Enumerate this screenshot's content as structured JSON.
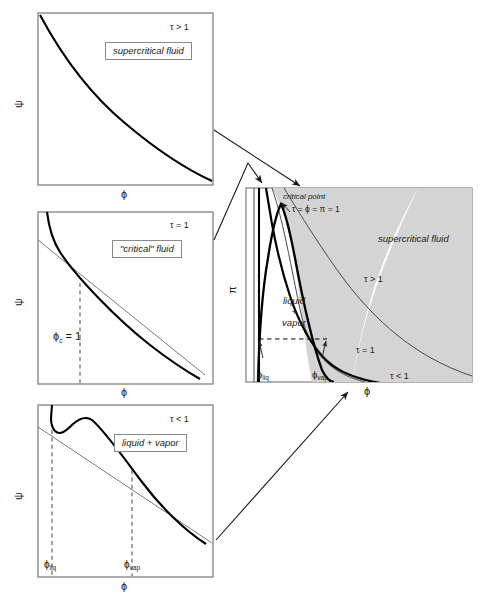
{
  "figure": {
    "type": "diagram",
    "colors": {
      "curve": "#000000",
      "tangent": "#5a5a5a",
      "frame": "#8a8a8a",
      "supercritical_shading": "#d4d4d4",
      "dashed": "#555555",
      "arrow": "#1a1a1a",
      "text": "#1a1a1a"
    }
  },
  "panels": {
    "top_left": {
      "name": "supercritical-panel",
      "tau_label": "τ > 1",
      "box_label": "supercritical fluid",
      "y_axis": "ψ",
      "x_axis": "ϕ"
    },
    "middle_left": {
      "name": "critical-panel",
      "tau_label": "τ = 1",
      "box_label": "\"critical\" fluid",
      "y_axis": "ψ",
      "x_axis": "ϕ",
      "phi_c_label": "ϕ",
      "phi_c_sub": "c",
      "phi_c_value": "= 1"
    },
    "bottom_left": {
      "name": "liquid-vapor-panel",
      "tau_label": "τ < 1",
      "box_label": "liquid + vapor",
      "y_axis": "ψ",
      "x_axis": "ϕ",
      "phi_liq": "ϕ",
      "phi_liq_sub": "liq",
      "phi_vap": "ϕ",
      "phi_vap_sub": "vap"
    },
    "main": {
      "name": "phase-diagram-panel",
      "y_axis": "π",
      "x_axis": "ϕ",
      "critical_point_label": "critical point",
      "critical_point_equation": "τ = ϕ = π = 1",
      "supercritical_label": "supercritical fluid",
      "two_phase_line1": "liquid",
      "two_phase_line2": "+",
      "two_phase_line3": "vapor",
      "isotherm_above": "τ > 1",
      "isotherm_at": "τ = 1",
      "isotherm_below": "τ < 1",
      "phi_liq": "ϕ",
      "phi_liq_sub": "liq",
      "phi_vap": "ϕ",
      "phi_vap_sub": "vap"
    }
  },
  "connectors": [
    {
      "name": "arrow-supercritical-to-main",
      "from": "top_left",
      "to": "main"
    },
    {
      "name": "arrow-critical-to-main",
      "from": "middle_left",
      "to": "main"
    },
    {
      "name": "arrow-liquidvapor-to-main",
      "from": "bottom_left",
      "to": "main"
    }
  ]
}
